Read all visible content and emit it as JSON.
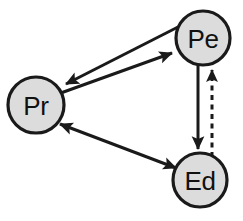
{
  "diagram": {
    "background_color": "#ffffff",
    "node_fill_color": "#dcdcdc",
    "node_stroke_color": "#1a1a1a",
    "edge_color": "#1a1a1a",
    "nodes": [
      {
        "id": "pe",
        "label": "Pe",
        "cx": 203,
        "cy": 38,
        "r": 27
      },
      {
        "id": "pr",
        "label": "Pr",
        "cx": 36,
        "cy": 105,
        "r": 28
      },
      {
        "id": "ed",
        "label": "Ed",
        "cx": 200,
        "cy": 180,
        "r": 27
      }
    ],
    "edges": [
      {
        "id": "pe-to-pr",
        "from": "Pe",
        "to": "Pr",
        "style": "solid",
        "arrows": "end",
        "direction": "Pe to Pr"
      },
      {
        "id": "pr-to-pe",
        "from": "Pr",
        "to": "Pe",
        "style": "solid",
        "arrows": "end",
        "direction": "Pr to Pe"
      },
      {
        "id": "pe-to-ed",
        "from": "Pe",
        "to": "Ed",
        "style": "solid",
        "arrows": "end",
        "direction": "Pe to Ed"
      },
      {
        "id": "ed-to-pe",
        "from": "Ed",
        "to": "Pe",
        "style": "dashed",
        "arrows": "end",
        "direction": "Ed to Pe"
      },
      {
        "id": "pr-ed",
        "from": "Pr",
        "to": "Ed",
        "style": "solid",
        "arrows": "both",
        "direction": "Pr to Ed and Ed to Pr"
      }
    ]
  }
}
